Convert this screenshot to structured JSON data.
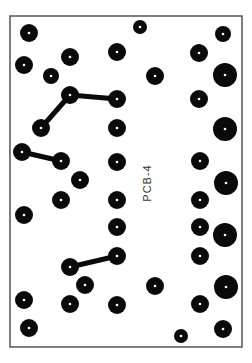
{
  "board": {
    "label": "PCB-4",
    "width": 252,
    "height": 363,
    "outline": {
      "x": 10,
      "y": 16,
      "w": 232,
      "h": 331
    },
    "colors": {
      "background": "#ffffff",
      "outline": "#555555",
      "pad": "#0a0a0a",
      "hole": "#ffffff",
      "trace": "#0a0a0a",
      "label": "#333333"
    },
    "pads": [
      {
        "x": 29,
        "y": 33,
        "r": 9
      },
      {
        "x": 140,
        "y": 27,
        "r": 7
      },
      {
        "x": 223,
        "y": 34,
        "r": 8
      },
      {
        "x": 24,
        "y": 65,
        "r": 9
      },
      {
        "x": 70,
        "y": 57,
        "r": 9
      },
      {
        "x": 117,
        "y": 52,
        "r": 9
      },
      {
        "x": 199,
        "y": 53,
        "r": 9
      },
      {
        "x": 51,
        "y": 76,
        "r": 8
      },
      {
        "x": 155,
        "y": 76,
        "r": 9
      },
      {
        "x": 225,
        "y": 75,
        "r": 12
      },
      {
        "x": 70,
        "y": 95,
        "r": 9
      },
      {
        "x": 117,
        "y": 99,
        "r": 9
      },
      {
        "x": 199,
        "y": 99,
        "r": 9
      },
      {
        "x": 41,
        "y": 128,
        "r": 9
      },
      {
        "x": 117,
        "y": 128,
        "r": 9
      },
      {
        "x": 225,
        "y": 129,
        "r": 12
      },
      {
        "x": 22,
        "y": 152,
        "r": 9
      },
      {
        "x": 61,
        "y": 161,
        "r": 9
      },
      {
        "x": 117,
        "y": 162,
        "r": 9
      },
      {
        "x": 200,
        "y": 161,
        "r": 9
      },
      {
        "x": 80,
        "y": 180,
        "r": 9
      },
      {
        "x": 226,
        "y": 183,
        "r": 12
      },
      {
        "x": 61,
        "y": 200,
        "r": 9
      },
      {
        "x": 117,
        "y": 200,
        "r": 9
      },
      {
        "x": 200,
        "y": 200,
        "r": 9
      },
      {
        "x": 24,
        "y": 215,
        "r": 9
      },
      {
        "x": 117,
        "y": 227,
        "r": 9
      },
      {
        "x": 200,
        "y": 227,
        "r": 9
      },
      {
        "x": 225,
        "y": 235,
        "r": 12
      },
      {
        "x": 117,
        "y": 256,
        "r": 9
      },
      {
        "x": 70,
        "y": 267,
        "r": 9
      },
      {
        "x": 200,
        "y": 256,
        "r": 9
      },
      {
        "x": 85,
        "y": 285,
        "r": 9
      },
      {
        "x": 155,
        "y": 286,
        "r": 9
      },
      {
        "x": 226,
        "y": 287,
        "r": 12
      },
      {
        "x": 24,
        "y": 300,
        "r": 9
      },
      {
        "x": 70,
        "y": 304,
        "r": 9
      },
      {
        "x": 117,
        "y": 305,
        "r": 9
      },
      {
        "x": 200,
        "y": 304,
        "r": 9
      },
      {
        "x": 29,
        "y": 328,
        "r": 9
      },
      {
        "x": 181,
        "y": 336,
        "r": 7
      },
      {
        "x": 223,
        "y": 329,
        "r": 9
      }
    ],
    "traces": [
      {
        "x1": 70,
        "y1": 95,
        "x2": 117,
        "y2": 99
      },
      {
        "x1": 70,
        "y1": 95,
        "x2": 41,
        "y2": 128
      },
      {
        "x1": 22,
        "y1": 152,
        "x2": 61,
        "y2": 161
      },
      {
        "x1": 70,
        "y1": 267,
        "x2": 117,
        "y2": 256
      }
    ]
  }
}
